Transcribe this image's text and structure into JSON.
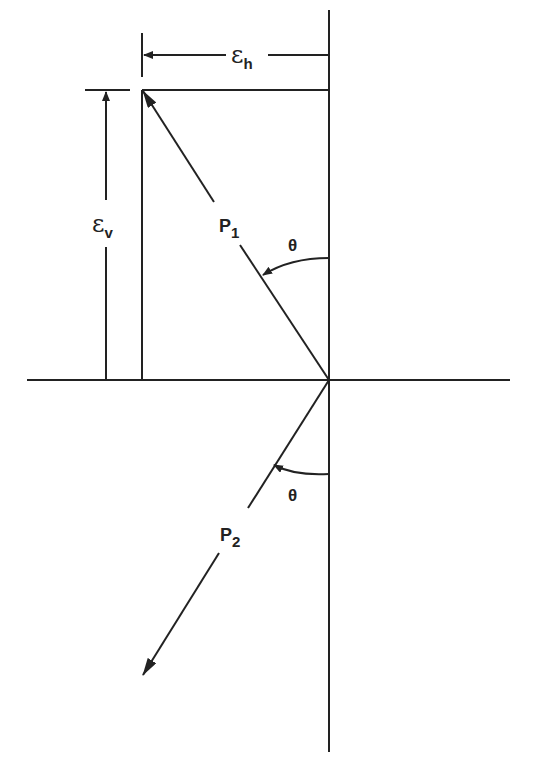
{
  "diagram": {
    "type": "vector-geometry",
    "line_color": "#222222",
    "background": "#ffffff",
    "labels": {
      "eps_h_main": "ε",
      "eps_h_sub": "h",
      "eps_v_main": "ε",
      "eps_v_sub": "v",
      "p1_main": "P",
      "p1_sub": "1",
      "p2_main": "P",
      "p2_sub": "2",
      "theta_upper": "θ",
      "theta_lower": "θ"
    },
    "elements": [
      {
        "name": "vertical-axis",
        "description": "vertical reference line through origin"
      },
      {
        "name": "horizontal-axis",
        "description": "horizontal reference line through origin"
      },
      {
        "name": "vector-p1",
        "description": "arrow from origin up-left to top-left corner"
      },
      {
        "name": "vector-p2",
        "description": "arrow from origin down-left"
      },
      {
        "name": "dimension-eps-h",
        "description": "horizontal offset dimension"
      },
      {
        "name": "dimension-eps-v",
        "description": "vertical offset dimension"
      },
      {
        "name": "angle-theta-upper",
        "description": "angle between P1 and vertical"
      },
      {
        "name": "angle-theta-lower",
        "description": "angle between P2 and vertical"
      }
    ]
  }
}
